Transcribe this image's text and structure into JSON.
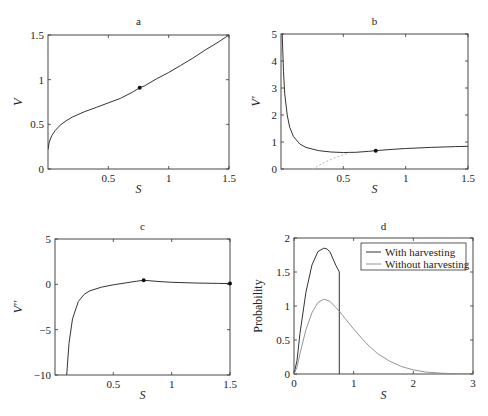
{
  "chart_data": [
    {
      "panel": "a",
      "type": "line",
      "title": "a",
      "xlabel": "S",
      "ylabel": "V",
      "xlim": [
        0,
        1.5
      ],
      "ylim": [
        0,
        1.5
      ],
      "xticks": [
        "0.5",
        "1",
        "1.5"
      ],
      "yticks": [
        "0",
        "0.5",
        "1",
        "1.5"
      ],
      "series": [
        {
          "name": "V",
          "x": [
            0.0,
            0.01,
            0.03,
            0.06,
            0.1,
            0.15,
            0.2,
            0.3,
            0.4,
            0.5,
            0.6,
            0.7,
            0.76,
            0.8,
            0.9,
            1.0,
            1.1,
            1.2,
            1.3,
            1.4,
            1.5
          ],
          "y": [
            0.22,
            0.3,
            0.37,
            0.43,
            0.49,
            0.54,
            0.58,
            0.64,
            0.69,
            0.74,
            0.79,
            0.86,
            0.91,
            0.93,
            1.01,
            1.08,
            1.16,
            1.24,
            1.33,
            1.41,
            1.5
          ]
        }
      ],
      "markers": [
        {
          "x": 0.76,
          "y": 0.91
        }
      ]
    },
    {
      "panel": "b",
      "type": "line",
      "title": "b",
      "xlabel": "S",
      "ylabel": "V'",
      "xlim": [
        0,
        1.5
      ],
      "ylim": [
        0,
        5
      ],
      "xticks": [
        "0.5",
        "1",
        "1.5"
      ],
      "yticks": [
        "0",
        "1",
        "2",
        "3",
        "4",
        "5"
      ],
      "series": [
        {
          "name": "V'",
          "x": [
            0.01,
            0.02,
            0.03,
            0.05,
            0.07,
            0.1,
            0.15,
            0.2,
            0.3,
            0.4,
            0.5,
            0.6,
            0.7,
            0.76,
            0.9,
            1.0,
            1.2,
            1.4,
            1.5
          ],
          "y": [
            5.0,
            3.6,
            2.8,
            2.0,
            1.55,
            1.2,
            0.93,
            0.8,
            0.68,
            0.63,
            0.61,
            0.62,
            0.65,
            0.68,
            0.73,
            0.76,
            0.8,
            0.83,
            0.84
          ]
        },
        {
          "name": "dotted",
          "style": "dotted",
          "x": [
            0.25,
            0.35,
            0.45,
            0.55
          ],
          "y": [
            0.0,
            0.25,
            0.45,
            0.6
          ]
        }
      ],
      "markers": [
        {
          "x": 0.76,
          "y": 0.68
        }
      ]
    },
    {
      "panel": "c",
      "type": "line",
      "title": "c",
      "xlabel": "S",
      "ylabel": "V''",
      "xlim": [
        0,
        1.5
      ],
      "ylim": [
        -10,
        5
      ],
      "xticks": [
        "0.5",
        "1",
        "1.5"
      ],
      "yticks": [
        "-10",
        "-5",
        "0",
        "5"
      ],
      "series": [
        {
          "name": "V''",
          "x": [
            0.1,
            0.12,
            0.15,
            0.2,
            0.25,
            0.3,
            0.4,
            0.5,
            0.6,
            0.7,
            0.76,
            0.9,
            1.0,
            1.2,
            1.4,
            1.5
          ],
          "y": [
            -10,
            -6.5,
            -3.8,
            -1.9,
            -1.1,
            -0.7,
            -0.3,
            -0.05,
            0.15,
            0.35,
            0.45,
            0.3,
            0.22,
            0.15,
            0.1,
            0.08
          ]
        }
      ],
      "markers": [
        {
          "x": 0.76,
          "y": 0.45
        },
        {
          "x": 1.5,
          "y": 0.08
        }
      ]
    },
    {
      "panel": "d",
      "type": "line",
      "title": "d",
      "xlabel": "S",
      "ylabel": "Probability",
      "xlim": [
        0,
        3
      ],
      "ylim": [
        0,
        2
      ],
      "xticks": [
        "0",
        "1",
        "2",
        "3"
      ],
      "yticks": [
        "0",
        "0.5",
        "1",
        "1.5",
        "2"
      ],
      "legend": [
        "With harvesting",
        "Without harvesting"
      ],
      "legend_position": "upper right",
      "series": [
        {
          "name": "With harvesting",
          "x": [
            0.0,
            0.05,
            0.1,
            0.2,
            0.3,
            0.4,
            0.5,
            0.55,
            0.6,
            0.7,
            0.76,
            0.76
          ],
          "y": [
            0.0,
            0.2,
            0.6,
            1.2,
            1.6,
            1.8,
            1.85,
            1.84,
            1.8,
            1.6,
            1.5,
            0.0
          ]
        },
        {
          "name": "Without harvesting",
          "x": [
            0.0,
            0.05,
            0.1,
            0.2,
            0.3,
            0.4,
            0.5,
            0.6,
            0.7,
            0.8,
            1.0,
            1.2,
            1.4,
            1.6,
            1.8,
            2.0,
            2.2,
            2.5,
            2.8,
            3.0
          ],
          "y": [
            0.0,
            0.1,
            0.3,
            0.65,
            0.9,
            1.05,
            1.1,
            1.07,
            0.98,
            0.88,
            0.66,
            0.46,
            0.3,
            0.19,
            0.11,
            0.06,
            0.03,
            0.01,
            0.003,
            0.0
          ]
        }
      ]
    }
  ]
}
